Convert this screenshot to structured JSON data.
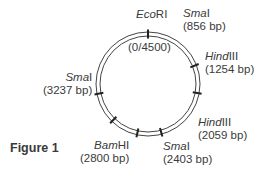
{
  "figure_label": "Figure 1",
  "plasmid": {
    "total_size_label": "(0/4500)",
    "total_bp": 4500
  },
  "sites": [
    {
      "enzyme_italic": "Eco",
      "enzyme_rest": "RI",
      "position_label": "",
      "bp": 0
    },
    {
      "enzyme_italic": "Sma",
      "enzyme_rest": "I",
      "position_label": "(856 bp)",
      "bp": 856
    },
    {
      "enzyme_italic": "Hind",
      "enzyme_rest": "III",
      "position_label": "(1254 bp)",
      "bp": 1254
    },
    {
      "enzyme_italic": "Hind",
      "enzyme_rest": "III",
      "position_label": "(2059 bp)",
      "bp": 2059
    },
    {
      "enzyme_italic": "Sma",
      "enzyme_rest": "I",
      "position_label": "(2403 bp)",
      "bp": 2403
    },
    {
      "enzyme_italic": "Bam",
      "enzyme_rest": "HI",
      "position_label": "(2800 bp)",
      "bp": 2800
    },
    {
      "enzyme_italic": "Sma",
      "enzyme_rest": "I",
      "position_label": "(3237 bp)",
      "bp": 3237
    }
  ]
}
